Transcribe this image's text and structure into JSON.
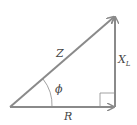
{
  "diagram": {
    "colors": {
      "line": "#8a8a8a",
      "text": "#444444"
    },
    "labels": {
      "hypotenuse": "Z",
      "vertical": "X",
      "vertical_sub": "L",
      "angle": "ϕ",
      "horizontal": "R"
    }
  }
}
